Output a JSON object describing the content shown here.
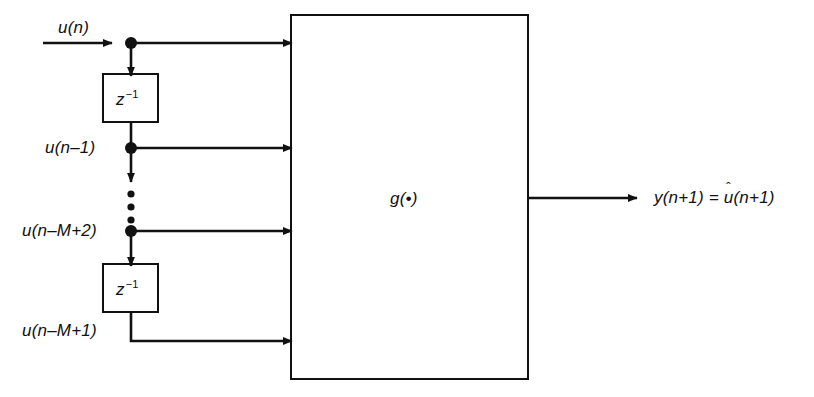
{
  "figure": {
    "type": "block-diagram",
    "background_color": "#ffffff",
    "line_color": "#111111"
  },
  "input": {
    "label": "u(n)"
  },
  "delays": [
    {
      "id": "delay-1",
      "label_z": "z",
      "label_exp": "−1"
    },
    {
      "id": "delay-2",
      "label_z": "z",
      "label_exp": "−1"
    }
  ],
  "taps": [
    {
      "id": "tap-0",
      "label": "u(n)"
    },
    {
      "id": "tap-1",
      "label": "u(n–1)"
    },
    {
      "id": "tap-2",
      "label": "u(n–M+2)"
    },
    {
      "id": "tap-3",
      "label": "u(n–M+1)"
    }
  ],
  "ellipsis": {
    "label": "vertical-ellipsis",
    "dot_count": 3
  },
  "block": {
    "label_main": "g",
    "label_open": "(",
    "label_dot": "•",
    "label_close": ")",
    "label_full": "g(•)"
  },
  "output": {
    "y_part": "y(n+1) = ",
    "u_hat_base": "u",
    "u_hat_mark": "ˆ",
    "u_hat_args": "(n+1)",
    "label_full": "y(n+1) = û(n+1)"
  }
}
